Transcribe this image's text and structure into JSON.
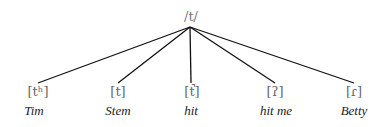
{
  "root": {
    "label": "/t/",
    "x": 190,
    "y": 8
  },
  "lines": {
    "color": "#111111",
    "origin": [
      190,
      27
    ]
  },
  "allophones": [
    {
      "phone": "[tʰ]",
      "word": "Tim",
      "x": 36
    },
    {
      "phone": "[t]",
      "word": "Stem",
      "x": 118
    },
    {
      "phone": "[t̚]",
      "word": "hit",
      "x": 191
    },
    {
      "phone": "[ʔ]",
      "word": "hit me",
      "x": 275
    },
    {
      "phone": "[ɾ]",
      "word": "Betty",
      "x": 354
    }
  ]
}
